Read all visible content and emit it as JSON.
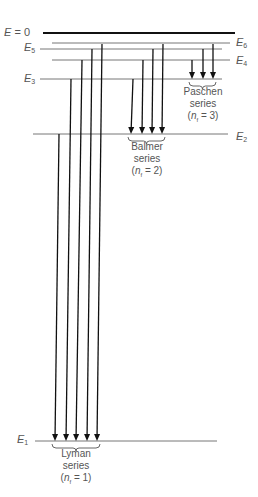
{
  "diagram": {
    "levels": [
      {
        "id": "E0",
        "label_var": "E",
        "label_sub": "",
        "label_suffix": " = 0",
        "y": 33,
        "x1": 43,
        "x2": 235,
        "width": 2.2,
        "label_side": "left",
        "label_x": 4,
        "label_y": 27
      },
      {
        "id": "E6",
        "label_var": "E",
        "label_sub": "6",
        "label_suffix": "",
        "y": 43,
        "x1": 52,
        "x2": 230,
        "width": 1,
        "label_side": "right",
        "label_x": 236,
        "label_y": 37
      },
      {
        "id": "E5",
        "label_var": "E",
        "label_sub": "5",
        "label_suffix": "",
        "y": 49,
        "x1": 40,
        "x2": 222,
        "width": 1,
        "label_side": "left",
        "label_x": 24,
        "label_y": 42
      },
      {
        "id": "E4",
        "label_var": "E",
        "label_sub": "4",
        "label_suffix": "",
        "y": 60,
        "x1": 52,
        "x2": 230,
        "width": 1,
        "label_side": "right",
        "label_x": 236,
        "label_y": 55
      },
      {
        "id": "E3",
        "label_var": "E",
        "label_sub": "3",
        "label_suffix": "",
        "y": 79,
        "x1": 40,
        "x2": 222,
        "width": 1,
        "label_side": "left",
        "label_x": 24,
        "label_y": 73
      },
      {
        "id": "E2",
        "label_var": "E",
        "label_sub": "2",
        "label_suffix": "",
        "y": 134,
        "x1": 33,
        "x2": 228,
        "width": 1,
        "label_side": "right",
        "label_x": 236,
        "label_y": 131
      },
      {
        "id": "E1",
        "label_var": "E",
        "label_sub": "1",
        "label_suffix": "",
        "y": 441,
        "x1": 35,
        "x2": 217,
        "width": 1,
        "label_side": "left",
        "label_x": 17,
        "label_y": 434
      }
    ],
    "series": [
      {
        "name": "Lyman",
        "label_line1": "Lyman",
        "label_line2": "series",
        "nf": "1",
        "label_x": 76,
        "label_y": 448,
        "transitions": [
          {
            "from": "E2",
            "x_top": 59,
            "y_top": 134,
            "x_bot": 55,
            "y_bot": 441
          },
          {
            "from": "E3",
            "x_top": 71,
            "y_top": 79,
            "x_bot": 66,
            "y_bot": 441
          },
          {
            "from": "E4",
            "x_top": 82,
            "y_top": 60,
            "x_bot": 76,
            "y_bot": 441
          },
          {
            "from": "E5",
            "x_top": 92,
            "y_top": 49,
            "x_bot": 87,
            "y_bot": 441
          },
          {
            "from": "E6",
            "x_top": 102,
            "y_top": 44,
            "x_bot": 97,
            "y_bot": 441
          }
        ]
      },
      {
        "name": "Balmer",
        "label_line1": "Balmer",
        "label_line2": "series",
        "nf": "2",
        "label_x": 147,
        "label_y": 141,
        "transitions": [
          {
            "from": "E3",
            "x_top": 133,
            "y_top": 79,
            "x_bot": 131,
            "y_bot": 134
          },
          {
            "from": "E4",
            "x_top": 143,
            "y_top": 60,
            "x_bot": 142,
            "y_bot": 134
          },
          {
            "from": "E5",
            "x_top": 153,
            "y_top": 49,
            "x_bot": 152,
            "y_bot": 134
          },
          {
            "from": "E6",
            "x_top": 163,
            "y_top": 44,
            "x_bot": 162,
            "y_bot": 134
          }
        ]
      },
      {
        "name": "Paschen",
        "label_line1": "Paschen",
        "label_line2": "series",
        "nf": "3",
        "label_x": 203,
        "label_y": 86,
        "transitions": [
          {
            "from": "E4",
            "x_top": 192,
            "y_top": 60,
            "x_bot": 192,
            "y_bot": 79
          },
          {
            "from": "E5",
            "x_top": 203,
            "y_top": 49,
            "x_bot": 203,
            "y_bot": 79
          },
          {
            "from": "E6",
            "x_top": 213,
            "y_top": 44,
            "x_bot": 213,
            "y_bot": 79
          }
        ]
      }
    ],
    "nf_prefix": "(",
    "nf_var": "n",
    "nf_sub": "f",
    "nf_mid": " = ",
    "nf_suffix": ")",
    "colors": {
      "arrow": "#111111",
      "level": "#777777",
      "ground_zero": "#111111",
      "text": "#555555"
    }
  }
}
